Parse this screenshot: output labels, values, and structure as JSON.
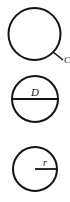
{
  "figure": {
    "stroke_color": "#16130f",
    "background_color": "#ffffff",
    "diagrams": [
      {
        "id": "circumference",
        "name": "circle-with-circumference-label",
        "label": "C",
        "label_meaning": "circumference",
        "annotation_type": "leader-line",
        "label_font_size": 9,
        "circle": {
          "cx": 34.5,
          "cy": 34,
          "r": 26,
          "stroke_width": 2
        },
        "leader": {
          "x1": 53,
          "y1": 52,
          "x2": 62,
          "y2": 59
        },
        "label_pos": {
          "x": 63,
          "y": 62
        }
      },
      {
        "id": "diameter",
        "name": "circle-with-diameter-label",
        "label": "D",
        "label_meaning": "diameter",
        "annotation_type": "diameter-line",
        "label_font_size": 11,
        "circle": {
          "cx": 35,
          "cy": 31,
          "r": 23,
          "stroke_width": 2
        },
        "line": {
          "x1": 12,
          "y1": 31,
          "x2": 58,
          "y2": 31,
          "stroke_width": 1.6
        },
        "label_pos": {
          "x": 35,
          "y": 28
        }
      },
      {
        "id": "radius",
        "name": "circle-with-radius-label",
        "label": "r",
        "label_meaning": "radius",
        "annotation_type": "radius-line",
        "label_font_size": 10,
        "circle": {
          "cx": 35,
          "cy": 33,
          "r": 22,
          "stroke_width": 2
        },
        "line": {
          "x1": 35,
          "y1": 33,
          "x2": 57,
          "y2": 33,
          "stroke_width": 1.6
        },
        "label_pos": {
          "x": 45,
          "y": 30
        }
      }
    ]
  }
}
